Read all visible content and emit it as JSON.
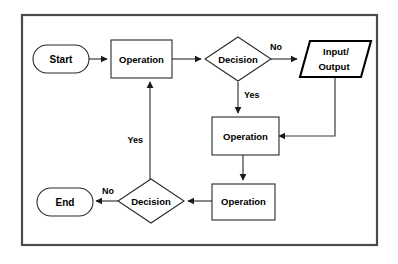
{
  "diagram": {
    "background_color": "#ffffff",
    "frame_color": "#4a4a4a",
    "shape_stroke_color": "#2b2b2b",
    "connector_color": "#3a3a3a",
    "nodes": {
      "start": {
        "label": "Start",
        "shape": "terminator"
      },
      "operation_1": {
        "label": "Operation",
        "shape": "process"
      },
      "decision_1": {
        "label": "Decision",
        "shape": "decision"
      },
      "input_output": {
        "label_line1": "Input/",
        "label_line2": "Output",
        "shape": "parallelogram"
      },
      "operation_2": {
        "label": "Operation",
        "shape": "process"
      },
      "operation_3": {
        "label": "Operation",
        "shape": "process"
      },
      "decision_2": {
        "label": "Decision",
        "shape": "decision"
      },
      "end": {
        "label": "End",
        "shape": "terminator"
      }
    },
    "edge_labels": {
      "decision_1_no": "No",
      "decision_1_yes": "Yes",
      "decision_2_no": "No",
      "decision_2_yes": "Yes"
    }
  }
}
